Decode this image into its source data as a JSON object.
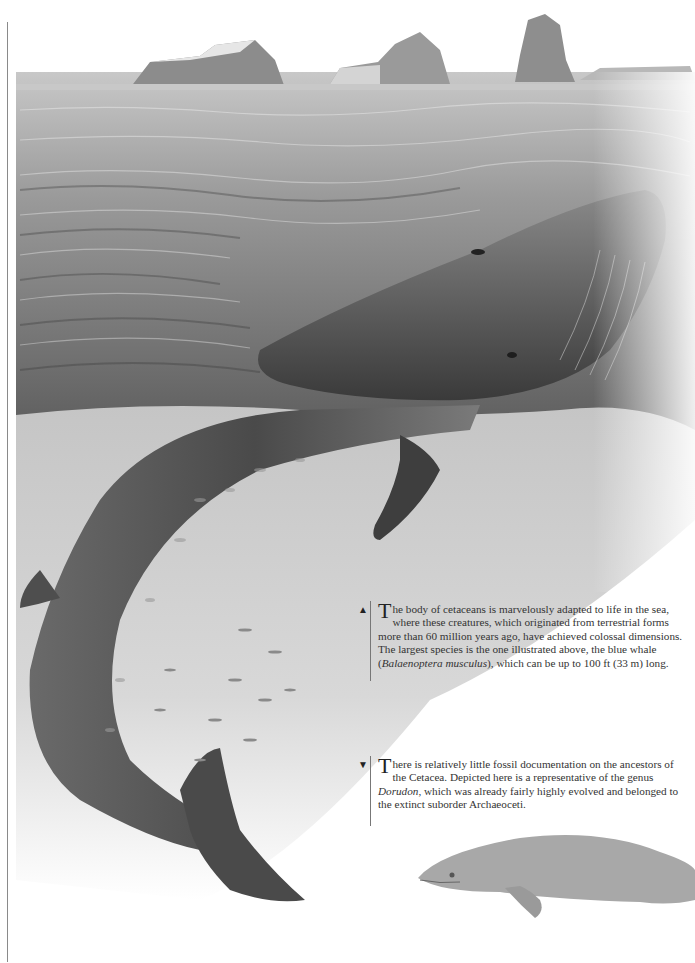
{
  "page": {
    "illustration_main": "Blue whale breaching at sea surface with icebergs on horizon",
    "illustration_secondary": "Dorudon (extinct archaeocete) illustration"
  },
  "captions": [
    {
      "marker": "▲",
      "dropcap": "T",
      "text_1": "he body of cetaceans is marvelously adapted to life in the sea, where these creatures, which originated from terrestrial forms more than 60 million years ago, have achieved colossal dimensions. The largest species is the one illustrated above, the blue whale (",
      "italic": "Balaenoptera musculus",
      "text_2": "), which can be up to 100 ft (33 m) long."
    },
    {
      "marker": "▼",
      "dropcap": "T",
      "text_1": "here is relatively little fossil documentation on the ancestors of the Cetacea. Depicted here is a representative of the genus ",
      "italic": "Dorudon",
      "text_2": ", which was already fairly highly evolved and belonged to the extinct suborder Archaeoceti."
    }
  ],
  "colors": {
    "sky": "#ffffff",
    "sea_light": "#b9b9b9",
    "sea_dark": "#5a5a5a",
    "whale_dark": "#3c3c3c",
    "whale_mid": "#6e6e6e",
    "underwater": "#d2d2d2",
    "dorudon": "#a8a8a8"
  }
}
